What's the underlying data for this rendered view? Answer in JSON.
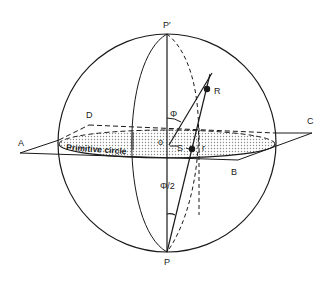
{
  "diagram": {
    "labels": {
      "north_pole": "P′",
      "south_pole": "P",
      "point_R": "R",
      "point_S": "S",
      "point_r": "r",
      "origin": "o",
      "corner_A": "A",
      "corner_B": "B",
      "corner_C": "C",
      "corner_D": "D",
      "primitive_circle": "Primitive circle",
      "angle_phi": "Φ",
      "angle_half_phi": "Φ/2"
    },
    "colors": {
      "stroke": "#1a1a1a",
      "shading": "#bdbdbd",
      "background": "#ffffff"
    }
  }
}
